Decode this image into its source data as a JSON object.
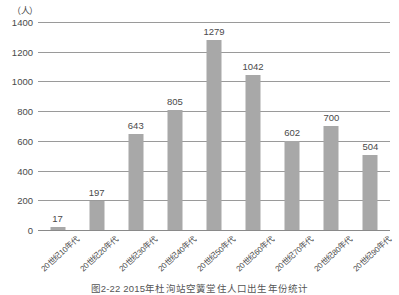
{
  "chart_data": {
    "type": "bar",
    "title": "",
    "caption": "图2-22  2015年杜洵站空簧堂住人口出生年份统计",
    "unit_label": "（人）",
    "xlabel": "",
    "ylabel": "",
    "ylim": [
      0,
      1400
    ],
    "ytick_step": 200,
    "yticks": [
      "0",
      "200",
      "400",
      "600",
      "800",
      "1000",
      "1200",
      "1400"
    ],
    "grid": "horizontal",
    "legend": "none",
    "bar_color": "#a8a8a8",
    "categories": [
      "20世纪10年代",
      "20世纪20年代",
      "20世纪30年代",
      "20世纪40年代",
      "20世纪50年代",
      "20世纪60年代",
      "20世纪70年代",
      "20世纪80年代",
      "20世纪90年代"
    ],
    "values": [
      17,
      197,
      643,
      805,
      1279,
      1042,
      602,
      700,
      504
    ],
    "value_labels": [
      "17",
      "197",
      "643",
      "805",
      "1279",
      "1042",
      "602",
      "700",
      "504"
    ]
  }
}
